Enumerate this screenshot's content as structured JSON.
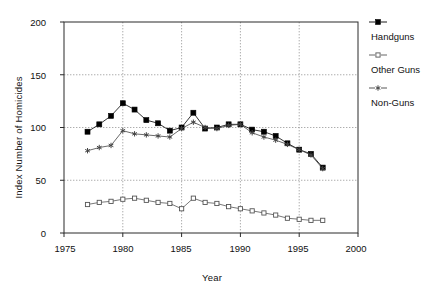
{
  "chart_data": {
    "type": "line",
    "title": "",
    "xlabel": "Year",
    "ylabel": "Index Number of Homicides",
    "xlim": [
      1975,
      2000
    ],
    "ylim": [
      0,
      200
    ],
    "xticks": [
      1975,
      1980,
      1985,
      1990,
      1995,
      2000
    ],
    "yticks": [
      0,
      50,
      100,
      150,
      200
    ],
    "grid": true,
    "legend_position": "right",
    "x": [
      1977,
      1978,
      1979,
      1980,
      1981,
      1982,
      1983,
      1984,
      1985,
      1986,
      1987,
      1988,
      1989,
      1990,
      1991,
      1992,
      1993,
      1994,
      1995,
      1996,
      1997
    ],
    "series": [
      {
        "name": "Handguns",
        "marker": "filled-square",
        "color": "#000000",
        "values": [
          96,
          103,
          111,
          123,
          117,
          107,
          104,
          97,
          100,
          114,
          99,
          100,
          103,
          103,
          98,
          96,
          92,
          85,
          79,
          75,
          62
        ]
      },
      {
        "name": "Other Guns",
        "marker": "open-square",
        "color": "#555555",
        "values": [
          27,
          29,
          30,
          32,
          33,
          31,
          29,
          28,
          23,
          33,
          29,
          28,
          25,
          23,
          21,
          19,
          17,
          14,
          13,
          12,
          12
        ]
      },
      {
        "name": "Non-Guns",
        "marker": "asterisk",
        "color": "#444444",
        "values": [
          78,
          81,
          83,
          97,
          94,
          93,
          92,
          91,
          99,
          105,
          100,
          99,
          102,
          103,
          95,
          91,
          88,
          84,
          79,
          74,
          61
        ]
      }
    ]
  },
  "axes": {
    "ylabel": "Index Number of Homicides",
    "xlabel": "Year",
    "ytick_labels": [
      "200",
      "150",
      "100",
      "50",
      "0"
    ],
    "xtick_labels": [
      "1975",
      "1980",
      "1985",
      "1990",
      "1995",
      "2000"
    ]
  },
  "legend": {
    "items": [
      {
        "label": "Handguns",
        "marker": "filled-square"
      },
      {
        "label": "Other Guns",
        "marker": "open-square"
      },
      {
        "label": "Non-Guns",
        "marker": "asterisk"
      }
    ]
  }
}
